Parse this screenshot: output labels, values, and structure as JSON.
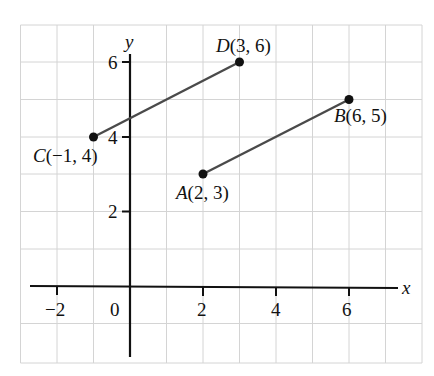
{
  "figure": {
    "axes": {
      "x_label": "x",
      "y_label": "y",
      "x_ticks": [
        {
          "value": -2,
          "label": "−2"
        },
        {
          "value": 0,
          "label": "0"
        },
        {
          "value": 2,
          "label": "2"
        },
        {
          "value": 4,
          "label": "4"
        },
        {
          "value": 6,
          "label": "6"
        }
      ],
      "y_ticks": [
        {
          "value": 2,
          "label": "2"
        },
        {
          "value": 4,
          "label": "4"
        },
        {
          "value": 6,
          "label": "6"
        }
      ],
      "grid": true,
      "x_range": [
        -3,
        8
      ],
      "y_range": [
        -2,
        7
      ]
    },
    "points": [
      {
        "name": "A",
        "coords": "(2, 3)",
        "x": 2,
        "y": 3
      },
      {
        "name": "B",
        "coords": "(6, 5)",
        "x": 6,
        "y": 5
      },
      {
        "name": "C",
        "coords": "(−1, 4)",
        "x": -1,
        "y": 4
      },
      {
        "name": "D",
        "coords": "(3, 6)",
        "x": 3,
        "y": 6
      }
    ],
    "segments": [
      {
        "from": "C",
        "to": "D"
      },
      {
        "from": "A",
        "to": "B"
      }
    ]
  }
}
